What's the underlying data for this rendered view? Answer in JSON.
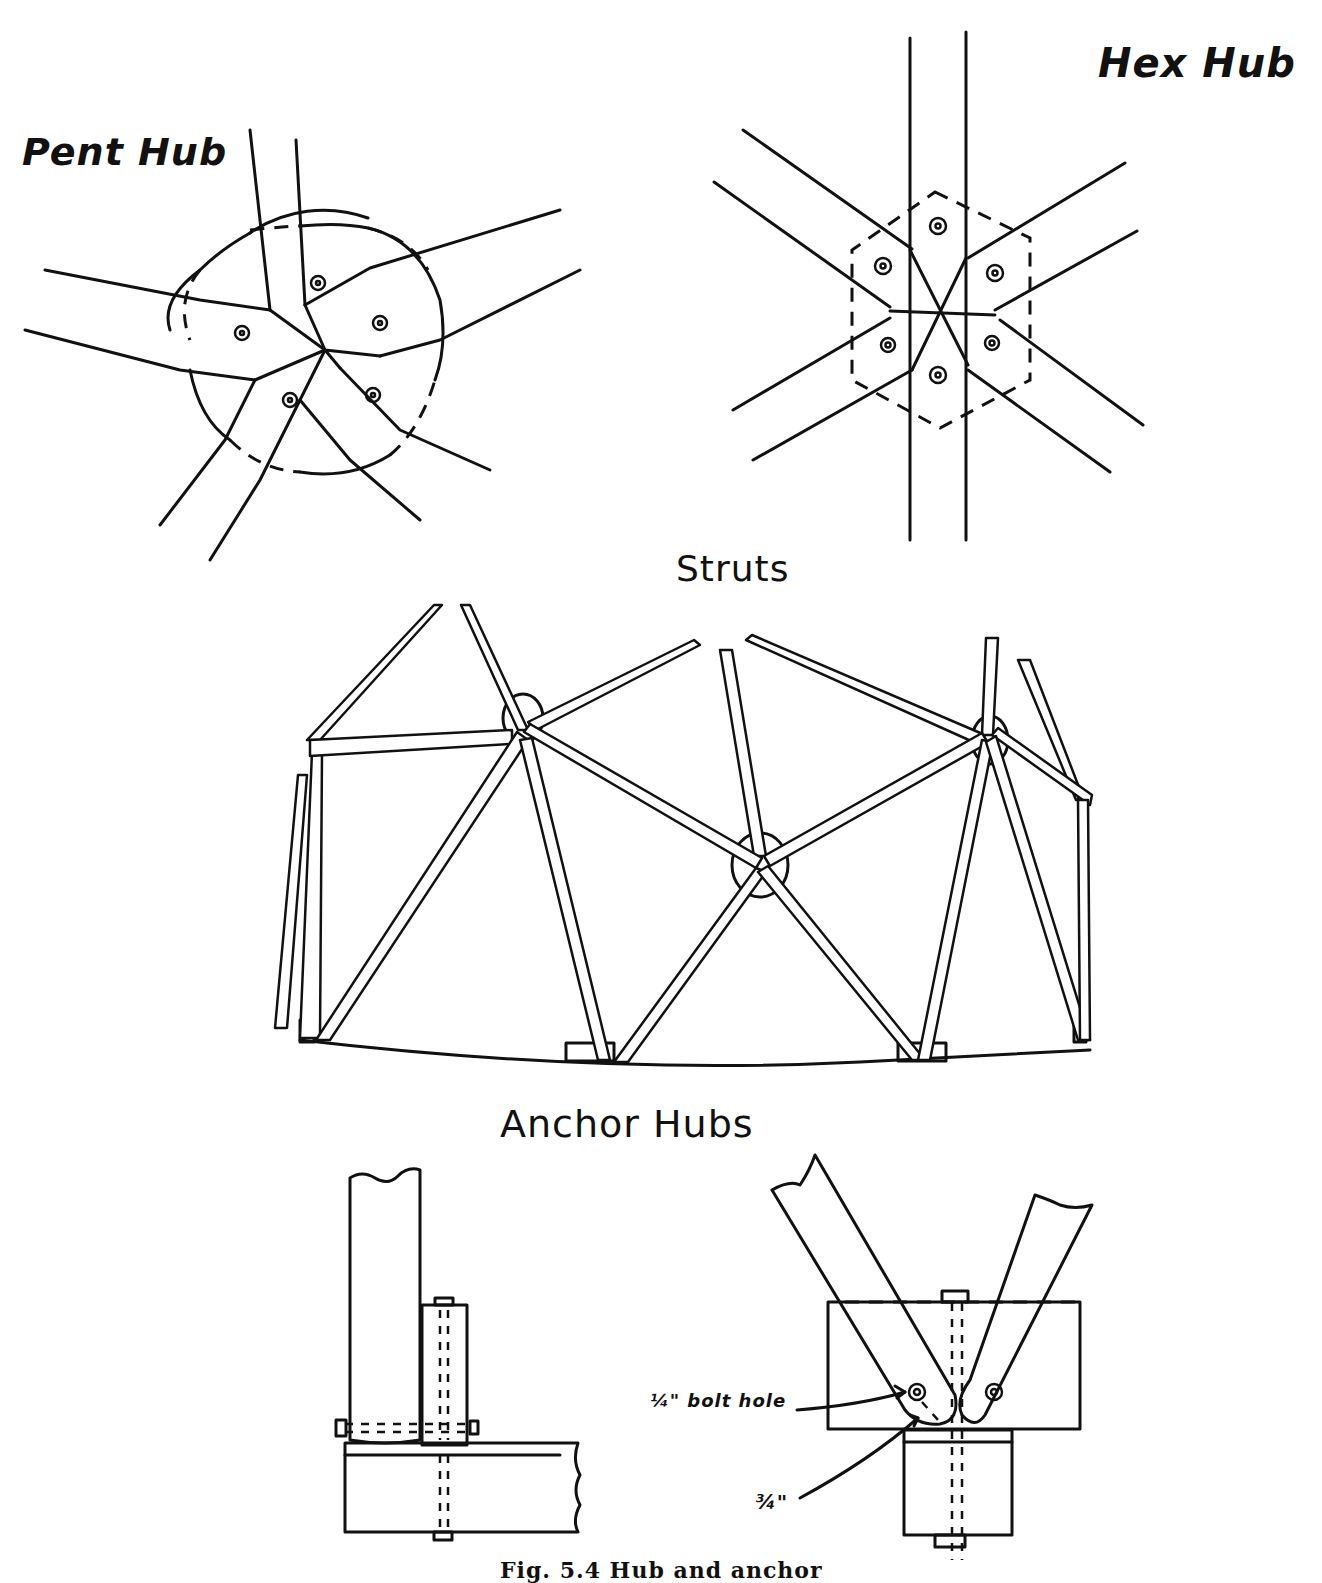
{
  "figure": {
    "caption": "Fig. 5.4   Hub and anchor",
    "sections": {
      "pent_hub": {
        "title": "Pent Hub",
        "strut_count": 5
      },
      "hex_hub": {
        "title": "Hex Hub",
        "strut_count": 6
      },
      "struts": {
        "title": "Struts"
      },
      "anchor_hubs": {
        "title": "Anchor Hubs",
        "annotations": {
          "bolt_hole": "¼\" bolt hole",
          "edge_distance": "¾\""
        }
      }
    }
  }
}
